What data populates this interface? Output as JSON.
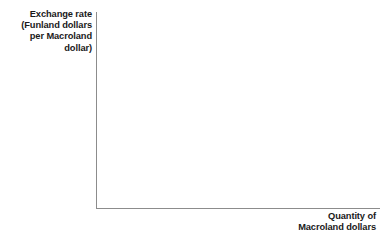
{
  "figure": {
    "background_color": "#ffffff",
    "axis_color": "#8c8c8c",
    "text_color": "#1a1a1a"
  },
  "chart_data": {
    "type": "line",
    "title": "",
    "subtitle": "",
    "xlabel": "Quantity of\nMacroland dollars",
    "ylabel": "Exchange rate\n(Funland dollars\nper Macroland\ndollar)",
    "xlabel_lines": [
      "Quantity of",
      "Macroland dollars"
    ],
    "ylabel_lines": [
      "Exchange rate",
      "(Funland dollars",
      "per Macroland",
      "dollar)"
    ],
    "series": [],
    "categories": [],
    "values": [],
    "x": [],
    "xticks": [],
    "yticks": [],
    "xticklabels": [],
    "yticklabels": [],
    "grid": false,
    "legend": false,
    "legend_position": "none",
    "annotations": [],
    "note": "Empty axes template: no data plotted, no tick marks, no gridlines"
  },
  "axes": {
    "y_axis_label": "Exchange rate\n(Funland dollars\nper Macroland\ndollar)",
    "x_axis_label": "Quantity of\nMacroland dollars"
  }
}
